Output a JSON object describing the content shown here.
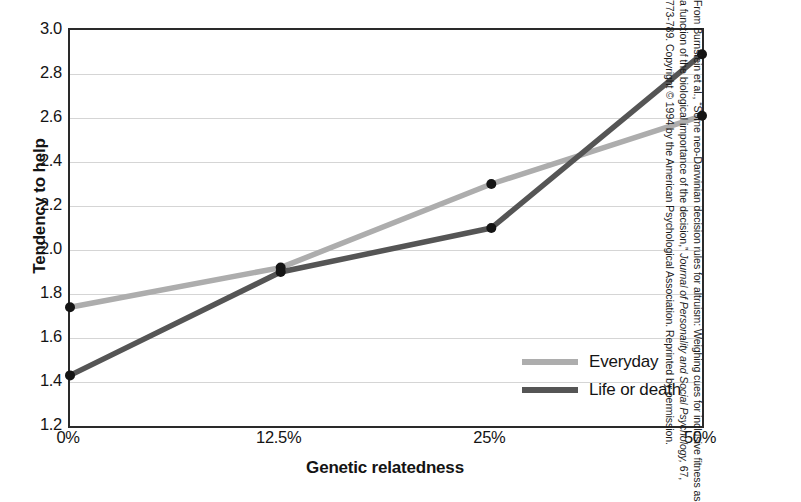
{
  "chart_data": {
    "type": "line",
    "title": "",
    "xlabel": "Genetic relatedness",
    "ylabel": "Tendency to help",
    "categories": [
      "0%",
      "12.5%",
      "25%",
      "50%"
    ],
    "ylim": [
      1.2,
      3.0
    ],
    "yticks": [
      "3.0",
      "2.8",
      "2.6",
      "2.4",
      "2.2",
      "2.0",
      "1.8",
      "1.6",
      "1.4",
      "1.2"
    ],
    "ytick_values": [
      3.0,
      2.8,
      2.6,
      2.4,
      2.2,
      2.0,
      1.8,
      1.6,
      1.4,
      1.2
    ],
    "grid": true,
    "grid_axis": "y",
    "legend_position": "bottom-right",
    "series": [
      {
        "name": "Everyday",
        "color": "#adadad",
        "values": [
          1.74,
          1.92,
          2.3,
          2.61
        ]
      },
      {
        "name": "Life or death",
        "color": "#555555",
        "values": [
          1.43,
          1.9,
          2.1,
          2.89
        ]
      }
    ]
  },
  "axes": {
    "y_title": "Tendency to help",
    "x_title": "Genetic relatedness"
  },
  "legend": {
    "items": [
      {
        "label": "Everyday",
        "color": "#adadad"
      },
      {
        "label": "Life or death",
        "color": "#555555"
      }
    ]
  },
  "credit": {
    "line1": "From Burnstein et al., “Some neo-Darwinian decision rules for altruism: Weighing cues",
    "line2_a": "for inclusive fitness as a function of the biological importance of the decision,” ",
    "line2_b": "Journal",
    "line3_a": "of Personality and Social Psychology,",
    "line3_b": " 67, 773-789. Copyright © 1994 by the American",
    "line4": "Psychological Association. Reprinted by permission."
  },
  "colors": {
    "axis": "#2a2a2a",
    "gridline": "#d5d5d5",
    "marker": "#141414",
    "background": "#ffffff"
  }
}
